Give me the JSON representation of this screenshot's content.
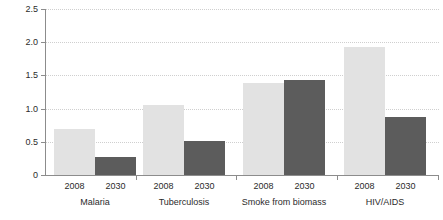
{
  "chart_data": {
    "type": "bar",
    "title": "",
    "xlabel": "",
    "ylabel": "Million",
    "ylim": [
      0,
      2.5
    ],
    "ytick_labels": [
      "2.5",
      "2.0",
      "1.5",
      "1.0",
      "0.5",
      "0"
    ],
    "ytick_values": [
      2.5,
      2.0,
      1.5,
      1.0,
      0.5,
      0
    ],
    "grid": true,
    "legend_position": "none",
    "categories": [
      "Malaria",
      "Tuberculosis",
      "Smoke from biomass",
      "HIV/AIDS"
    ],
    "subcategories": [
      "2008",
      "2030"
    ],
    "series": [
      {
        "name": "2008",
        "color": "#e2e2e2",
        "values": [
          0.7,
          1.05,
          1.39,
          1.93
        ]
      },
      {
        "name": "2030",
        "color": "#5c5c5c",
        "values": [
          0.27,
          0.51,
          1.43,
          0.88
        ]
      }
    ],
    "groups": [
      {
        "label": "Malaria",
        "bars": [
          {
            "year": "2008",
            "value": 0.7,
            "style": "light"
          },
          {
            "year": "2030",
            "value": 0.27,
            "style": "dark"
          }
        ]
      },
      {
        "label": "Tuberculosis",
        "bars": [
          {
            "year": "2008",
            "value": 1.05,
            "style": "light"
          },
          {
            "year": "2030",
            "value": 0.51,
            "style": "dark"
          }
        ]
      },
      {
        "label": "Smoke from biomass",
        "bars": [
          {
            "year": "2008",
            "value": 1.39,
            "style": "light"
          },
          {
            "year": "2030",
            "value": 1.43,
            "style": "dark"
          }
        ]
      },
      {
        "label": "HIV/AIDS",
        "bars": [
          {
            "year": "2008",
            "value": 1.93,
            "style": "light"
          },
          {
            "year": "2030",
            "value": 0.88,
            "style": "dark"
          }
        ]
      }
    ]
  },
  "colors": {
    "bar_light": "#e2e2e2",
    "bar_dark": "#5c5c5c",
    "axis": "#8c8c8c",
    "grid": "#cfcfcf",
    "text": "#2b2b2b",
    "background": "#ffffff"
  }
}
